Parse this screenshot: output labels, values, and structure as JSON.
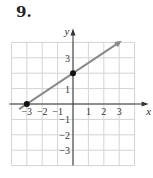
{
  "problem_number": "9.",
  "chart_data": {
    "type": "line",
    "title": "",
    "xlabel": "x",
    "ylabel": "y",
    "xlim": [
      -4,
      4
    ],
    "ylim": [
      -4,
      4
    ],
    "grid": true,
    "x_tick_labels": [
      "-3",
      "-2",
      "-1",
      "1",
      "2",
      "3"
    ],
    "y_tick_labels": [
      "3",
      "1",
      "-1",
      "-2",
      "-3"
    ],
    "series": [
      {
        "name": "line",
        "equation": "y = (2/3)x + 2",
        "x_start": -3.5,
        "x_end": 3,
        "arrow_end": true,
        "color": "#8a8a8a"
      }
    ],
    "points": [
      {
        "x": -3,
        "y": 0,
        "label": "x-intercept"
      },
      {
        "x": 0,
        "y": 2,
        "label": "y-intercept"
      }
    ]
  },
  "colors": {
    "grid": "#d4d4d4",
    "axis": "#333333",
    "line": "#8a8a8a",
    "point": "#111111"
  }
}
